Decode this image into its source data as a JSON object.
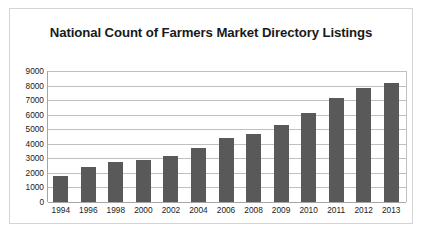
{
  "chart_data": {
    "type": "bar",
    "title": "National Count of Farmers Market Directory Listings",
    "xlabel": "",
    "ylabel": "",
    "categories": [
      "1994",
      "1996",
      "1998",
      "2000",
      "2002",
      "2004",
      "2006",
      "2008",
      "2009",
      "2010",
      "2011",
      "2012",
      "2013"
    ],
    "values": [
      1755,
      2410,
      2746,
      2863,
      3137,
      3706,
      4385,
      4685,
      5274,
      6132,
      7175,
      7864,
      8144
    ],
    "series": [
      {
        "name": "Farmers Market Directory Listings",
        "values": [
          1755,
          2410,
          2746,
          2863,
          3137,
          3706,
          4385,
          4685,
          5274,
          6132,
          7175,
          7864,
          8144
        ]
      }
    ],
    "ylim": [
      0,
      9000
    ],
    "ytick_labels": [
      "9000",
      "8000",
      "7000",
      "6000",
      "5000",
      "4000",
      "3000",
      "2000",
      "1000",
      "0"
    ],
    "ytick_values": [
      9000,
      8000,
      7000,
      6000,
      5000,
      4000,
      3000,
      2000,
      1000,
      0
    ],
    "grid": true,
    "legend": false,
    "bar_color": "#595959",
    "gridline_color": "#bfbfbf",
    "axis_color": "#a6a6a6",
    "frame_color": "#d4d4d4",
    "text_color": "#1a1a1a",
    "background": "#ffffff"
  }
}
